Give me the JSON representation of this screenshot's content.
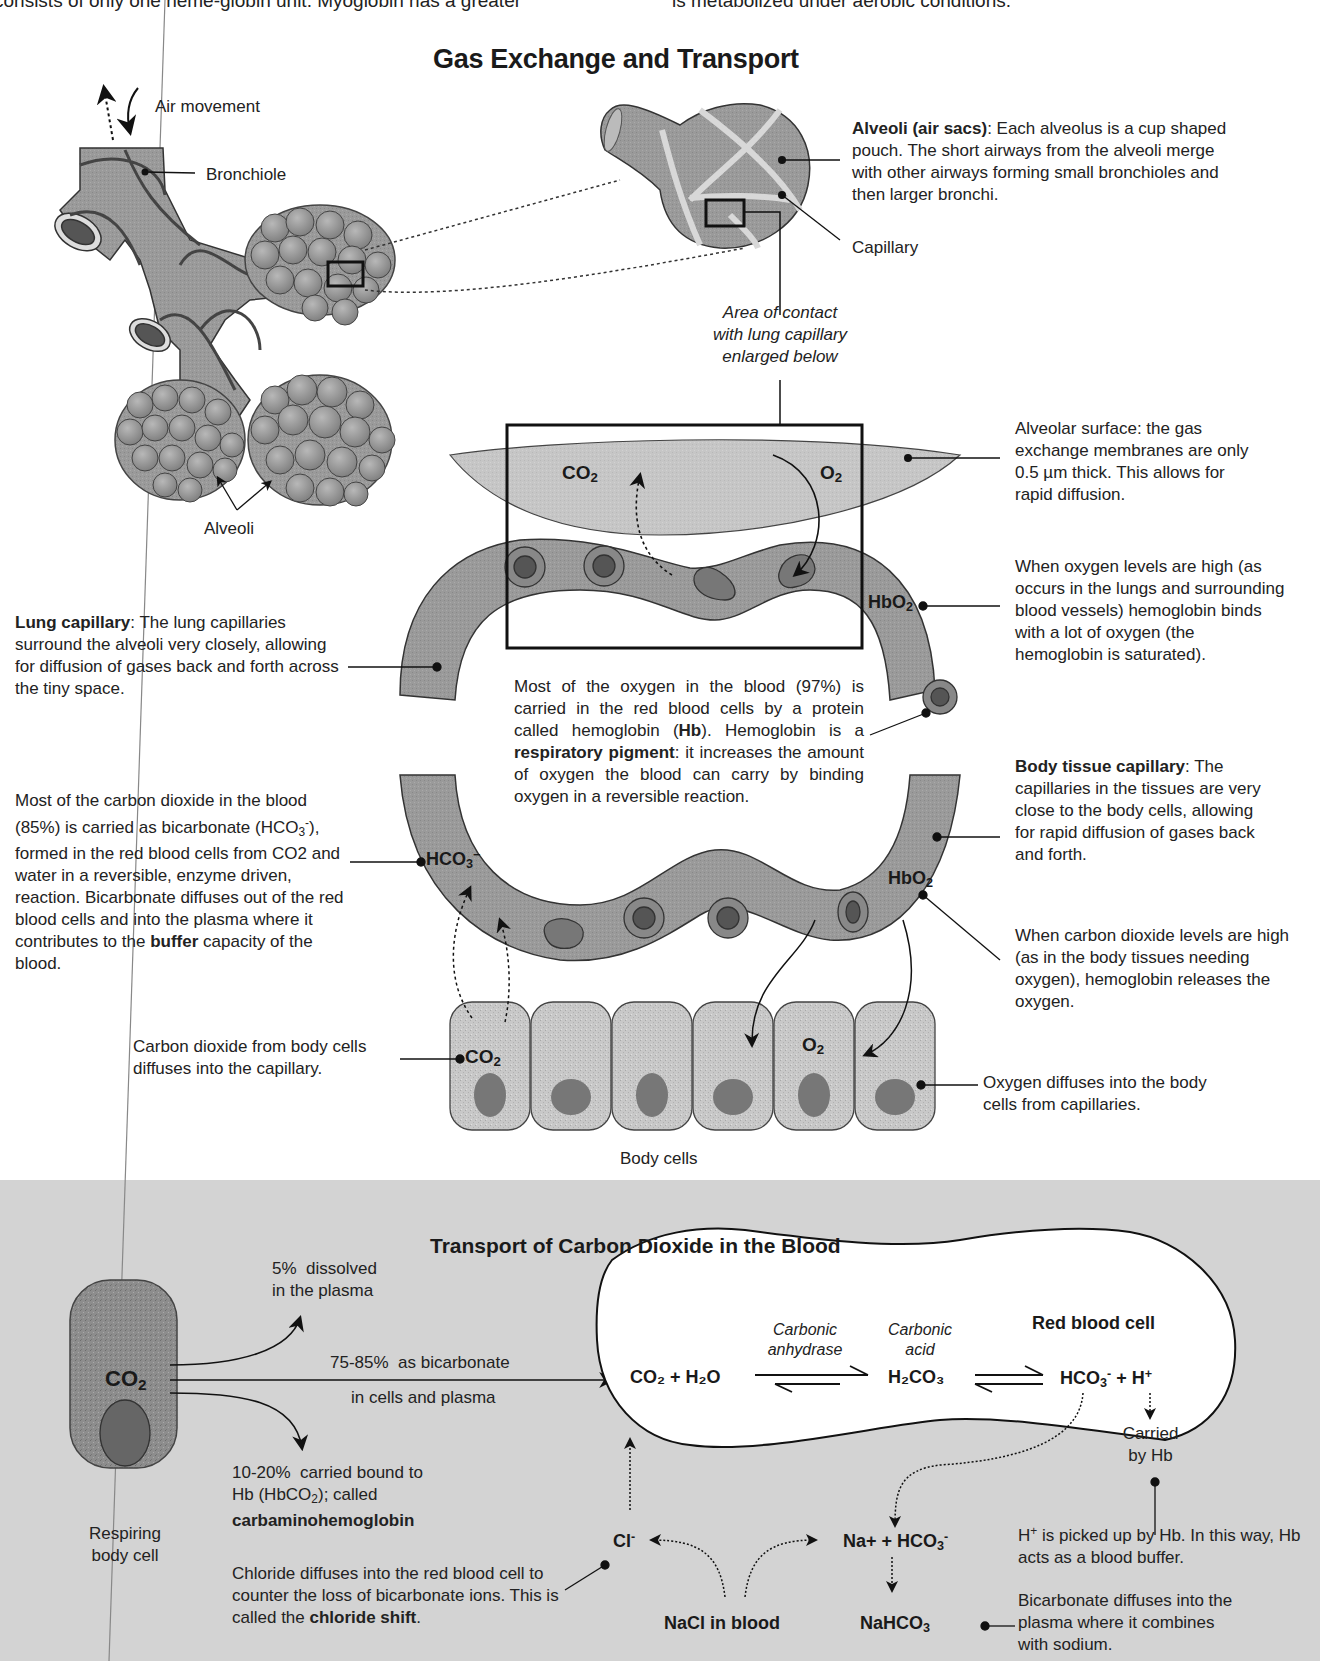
{
  "page_top": {
    "left_fragment": "consists of only one heme-globin unit. Myoglobin has a greater",
    "right_fragment": "is metabolized under aerobic conditions."
  },
  "top_diagram": {
    "title": "Gas Exchange and Transport",
    "labels": {
      "air_movement": "Air movement",
      "bronchiole": "Bronchiole",
      "alveoli": "Alveoli",
      "capillary": "Capillary",
      "area_of_contact": [
        "Area of contact",
        "with lung capillary",
        "enlarged below"
      ],
      "body_cells": "Body cells"
    },
    "alveoli_note": {
      "bold": "Alveoli (air sacs)",
      "text": ": Each alveolus is a cup shaped pouch. The short airways from the alveoli merge with other airways forming small bronchioles and then larger bronchi."
    },
    "alveolar_surface_note": "Alveolar surface: the gas exchange membranes are only 0.5 µm thick. This allows for rapid diffusion.",
    "oxygen_high_note": "When oxygen levels are high (as occurs in the lungs and surrounding blood vessels) hemoglobin binds with a lot of oxygen  (the hemoglobin is saturated).",
    "lung_capillary_note": {
      "bold": "Lung capillary",
      "text": ": The lung capillaries surround the alveoli very closely, allowing for diffusion of gases back and forth across the tiny space."
    },
    "oxygen_in_blood_note": {
      "part1": "Most of the oxygen in the blood (97%) is carried in the red blood cells by a protein called hemoglobin (",
      "hb": "Hb",
      "part2": "). Hemoglobin is a ",
      "pigment": "respiratory pigment",
      "part3": ": it increases the amount of oxygen the blood can carry by binding oxygen in a reversible reaction."
    },
    "body_tissue_capillary_note": {
      "bold": "Body tissue capillary",
      "text": ": The capillaries in the tissues are very close to the body cells, allowing for rapid diffusion of gases back and forth."
    },
    "co2_in_blood_note": {
      "part1": "Most of the carbon dioxide in the blood (85%) is carried as bicarbonate (HCO",
      "part2": "), formed in the red blood cells from CO2 and water in a reversible, enzyme driven, reaction. Bicarbonate diffuses out of the red blood cells and into the plasma where it contributes to the ",
      "buffer": "buffer",
      "part3": " capacity of the blood."
    },
    "co2_high_note": "When carbon dioxide levels are high (as in the body tissues needing oxygen), hemoglobin releases the oxygen.",
    "co2_from_cells_note": "Carbon dioxide from body cells diffuses into the capillary.",
    "oxygen_diffuses_note": "Oxygen diffuses into the body cells from capillaries.",
    "chem_labels": {
      "co2": "CO",
      "o2": "O",
      "hbo2": "HbO",
      "hco3": "HCO",
      "sub2": "2",
      "sub3": "3",
      "minus": "−"
    }
  },
  "bottom_panel": {
    "title": "Transport of Carbon Dioxide in the Blood",
    "background_color": "#d3d3d3",
    "respiring_cell": {
      "co2_label": "CO",
      "sub": "2",
      "caption": [
        "Respiring",
        "body cell"
      ]
    },
    "pathways": [
      {
        "percent": "5%",
        "text": "dissolved",
        "text2": "in the plasma"
      },
      {
        "percent": "75-85%",
        "text": "as bicarbonate",
        "text2": "in cells and plasma"
      },
      {
        "percent": "10-20%",
        "text": "carried bound to",
        "text2a": "Hb (HbCO",
        "text2b": "); called",
        "bold": "carbaminohemoglobin"
      }
    ],
    "red_blood_cell": {
      "label": "Red blood cell",
      "enzyme": [
        "Carbonic",
        "anhydrase"
      ],
      "acid": [
        "Carbonic",
        "acid"
      ],
      "reactant": "CO₂ + H₂O",
      "intermediate": "H₂CO₃",
      "product_hco3": "HCO",
      "product_h": "+ H",
      "carried_by_hb": [
        "Carried",
        "by Hb"
      ]
    },
    "plasma_species": {
      "cl": "Cl",
      "na_hco3": "Na+ + HCO",
      "nahco3": "NaHCO",
      "nacl": "NaCl in blood"
    },
    "notes": {
      "chloride": {
        "text": "Chloride diffuses into the red blood cell to counter the loss of bicarbonate ions. This is called the ",
        "bold": "chloride shift",
        "end": "."
      },
      "h_plus": {
        "sup_label": "H",
        "text": " is picked up by Hb. In this way, Hb acts as a blood buffer."
      },
      "bicarbonate": "Bicarbonate diffuses into the plasma where it combines with sodium."
    }
  }
}
